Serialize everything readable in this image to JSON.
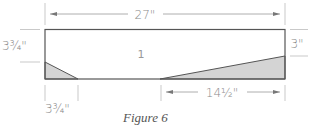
{
  "figure": {
    "caption": "Figure 6",
    "part_label": "1",
    "dimensions": {
      "overall_length": "27\"",
      "left_height": "3¾\"",
      "right_height": "3\"",
      "left_taper_length": "3¾\"",
      "right_taper_length": "14½\""
    },
    "colors": {
      "outline": "#555555",
      "shade": "#d4d4d4",
      "dimension_line": "#b0b0b0"
    }
  }
}
